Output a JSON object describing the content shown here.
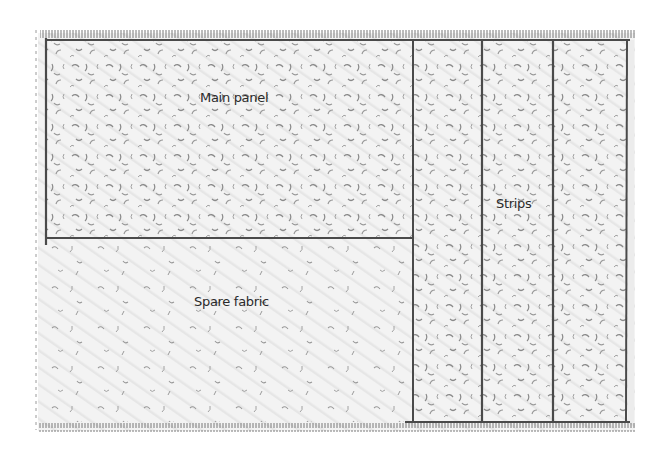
{
  "diagram": {
    "type": "fabric-cutting-layout",
    "style": "pencil-sketch",
    "colors": {
      "background": "#ffffff",
      "fabric_fill": "#f1f1f1",
      "lines": "#4a4a4a",
      "speckles": "#8a8a8a",
      "text": "#2a2a2a"
    },
    "regions": [
      {
        "id": "main-panel",
        "label": "Main panel"
      },
      {
        "id": "spare-fabric",
        "label": "Spare fabric"
      },
      {
        "id": "strips",
        "label": "Strips",
        "count": 3
      }
    ]
  }
}
